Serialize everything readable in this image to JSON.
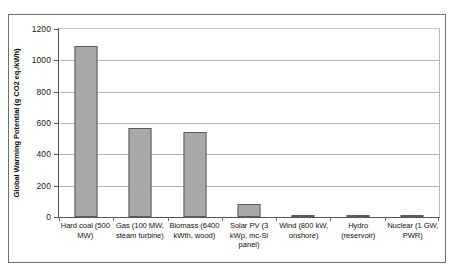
{
  "chart_data": {
    "type": "bar",
    "title": "",
    "xlabel": "",
    "ylabel": "Global Warming Potential (g CO2 eq./kWh)",
    "ylim": [
      0,
      1200
    ],
    "ytick_labels": [
      "1200",
      "1000",
      "800",
      "600",
      "400",
      "200",
      "0"
    ],
    "ytick_values": [
      1200,
      1000,
      800,
      600,
      400,
      200,
      0
    ],
    "grid": true,
    "legend": "none",
    "categories": [
      "Hard coal (500 MW)",
      "Gas (100 MW, steam turbine)",
      "Biomass (6400 kWth, wood)",
      "Solar PV (3 kWp, mc-Si panel)",
      "Wind (800 kW, onshore)",
      "Hydro (reservoir)",
      "Nuclear (1 GW, PWR)"
    ],
    "values": [
      1090,
      565,
      545,
      85,
      12,
      10,
      10
    ],
    "bar_color": "#a9a9a9",
    "bar_edge_color": "#5d5d5d",
    "gridline_color": "#b5b5b5",
    "axis_color": "#555555"
  }
}
